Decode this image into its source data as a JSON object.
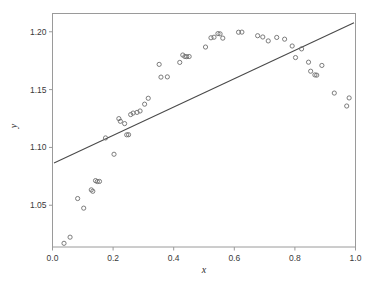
{
  "chart_data": {
    "type": "scatter",
    "title": "",
    "subtitle": "",
    "xlabel": "x",
    "ylabel": "y",
    "xlim": [
      0.0,
      1.0
    ],
    "ylim": [
      1.0139,
      1.2158
    ],
    "grid": false,
    "legend": null,
    "xticks": [
      0.0,
      0.2,
      0.4,
      0.6,
      0.8,
      1.0
    ],
    "xtick_labels": [
      "0.0",
      "0.2",
      "0.4",
      "0.6",
      "0.8",
      "1.0"
    ],
    "yticks": [
      1.05,
      1.1,
      1.15,
      1.2
    ],
    "ytick_labels": [
      "1.05",
      "1.10",
      "1.15",
      "1.20"
    ],
    "marker": {
      "style": "open-circle",
      "radius": 2.1,
      "edge_color": "#6e6e6e",
      "fill": "none"
    },
    "series": [
      {
        "name": "observations",
        "type": "scatter",
        "points": [
          [
            0.038,
            1.0171
          ],
          [
            0.058,
            1.0224
          ],
          [
            0.083,
            1.0558
          ],
          [
            0.103,
            1.0475
          ],
          [
            0.128,
            1.0633
          ],
          [
            0.133,
            1.0621
          ],
          [
            0.142,
            1.0713
          ],
          [
            0.148,
            1.0705
          ],
          [
            0.155,
            1.0706
          ],
          [
            0.175,
            1.1082
          ],
          [
            0.203,
            1.0941
          ],
          [
            0.219,
            1.1249
          ],
          [
            0.224,
            1.1226
          ],
          [
            0.238,
            1.1206
          ],
          [
            0.245,
            1.1109
          ],
          [
            0.251,
            1.111
          ],
          [
            0.258,
            1.1284
          ],
          [
            0.266,
            1.1297
          ],
          [
            0.279,
            1.1303
          ],
          [
            0.289,
            1.1315
          ],
          [
            0.304,
            1.1374
          ],
          [
            0.316,
            1.1425
          ],
          [
            0.352,
            1.1718
          ],
          [
            0.358,
            1.1608
          ],
          [
            0.379,
            1.161
          ],
          [
            0.42,
            1.1735
          ],
          [
            0.43,
            1.1799
          ],
          [
            0.437,
            1.1786
          ],
          [
            0.443,
            1.1785
          ],
          [
            0.451,
            1.1786
          ],
          [
            0.505,
            1.1868
          ],
          [
            0.523,
            1.1948
          ],
          [
            0.533,
            1.1953
          ],
          [
            0.546,
            1.1984
          ],
          [
            0.553,
            1.1982
          ],
          [
            0.562,
            1.1945
          ],
          [
            0.614,
            1.1996
          ],
          [
            0.625,
            1.1997
          ],
          [
            0.677,
            1.1966
          ],
          [
            0.694,
            1.1955
          ],
          [
            0.712,
            1.1921
          ],
          [
            0.74,
            1.1951
          ],
          [
            0.766,
            1.1936
          ],
          [
            0.791,
            1.1877
          ],
          [
            0.802,
            1.1777
          ],
          [
            0.822,
            1.1852
          ],
          [
            0.845,
            1.1737
          ],
          [
            0.852,
            1.1659
          ],
          [
            0.866,
            1.1627
          ],
          [
            0.872,
            1.1625
          ],
          [
            0.889,
            1.1709
          ],
          [
            0.93,
            1.147
          ],
          [
            0.971,
            1.1358
          ],
          [
            0.979,
            1.1428
          ]
        ]
      },
      {
        "name": "linear-fit",
        "type": "line",
        "x_start": 0.005,
        "y_start": 1.0865,
        "x_end": 0.995,
        "y_end": 1.2077,
        "color": "#4a4a4a"
      }
    ]
  },
  "axes": {
    "x_axis_title": "x",
    "y_axis_title": "y"
  }
}
